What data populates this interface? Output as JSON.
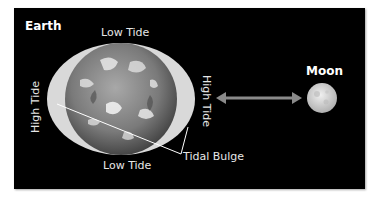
{
  "diagram": {
    "labels": {
      "earth": "Earth",
      "moon": "Moon",
      "low_tide_top": "Low Tide",
      "low_tide_bottom": "Low Tide",
      "high_tide_left": "High Tide",
      "high_tide_right": "High Tide",
      "tidal_bulge": "Tidal Bulge"
    },
    "colors": {
      "background": "#000000",
      "bulge": "#d9d9d9",
      "earth": "#8c8c8c",
      "arrow": "#8a8a8a",
      "moon": "#d6d6d6",
      "text": "#e6e6e6",
      "leader_lines": "#ffffff"
    }
  }
}
